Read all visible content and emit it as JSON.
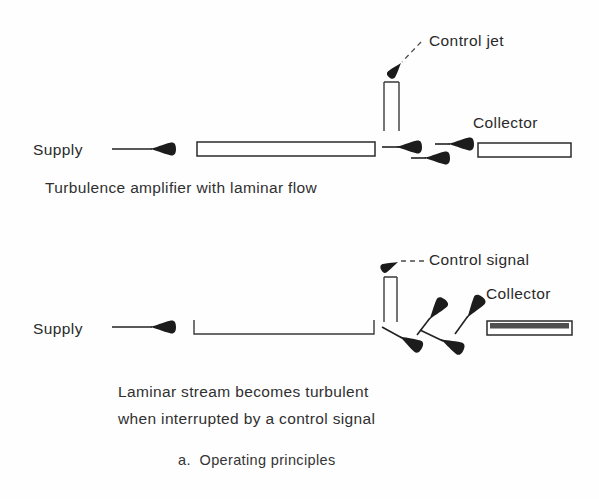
{
  "figure": {
    "caption": "a.  Operating principles",
    "panels": [
      {
        "id": "upper",
        "supply_label": "Supply",
        "control_label": "Control jet",
        "collector_label": "Collector",
        "caption": "Turbulence amplifier with laminar flow",
        "flow_state": "laminar",
        "nozzle_style": "closed-rectangle",
        "collector_style": "hollow-rectangle",
        "stream_arrow_count": 3
      },
      {
        "id": "lower",
        "supply_label": "Supply",
        "control_label": "Control signal",
        "collector_label": "Collector",
        "caption_line_1": "Laminar stream becomes turbulent",
        "caption_line_2": "when interrupted by a control signal",
        "flow_state": "turbulent",
        "nozzle_style": "open-u-channel",
        "collector_style": "shaded-rectangle",
        "stream_arrow_count": 4
      }
    ]
  },
  "colors": {
    "ink": "#1a1a1a",
    "outline": "#2b2b2b",
    "page": "#ffffff",
    "leader": "#4a4a4a"
  }
}
